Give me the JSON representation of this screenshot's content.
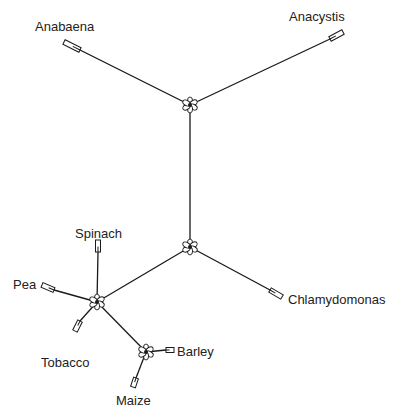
{
  "diagram": {
    "type": "unrooted phylogenetic tree",
    "stroke_color": "#1a1a1a",
    "background": "#ffffff",
    "nodes": [
      {
        "id": "n_top",
        "x": 190,
        "y": 105
      },
      {
        "id": "n_mid",
        "x": 190,
        "y": 247
      },
      {
        "id": "n_plant",
        "x": 97,
        "y": 302
      },
      {
        "id": "n_grass",
        "x": 146,
        "y": 352
      }
    ],
    "leaves": [
      {
        "name": "Anabaena",
        "node": "n_top",
        "tip": [
          64,
          42
        ],
        "box_start": [
          80,
          50
        ],
        "label_pos": [
          35,
          20
        ]
      },
      {
        "name": "Anacystis",
        "node": "n_top",
        "tip": [
          343,
          32
        ],
        "box_start": [
          330,
          39
        ],
        "label_pos": [
          289,
          10
        ]
      },
      {
        "name": "Chlamydomonas",
        "node": "n_mid",
        "tip": [
          282,
          297
        ],
        "box_start": [
          270,
          290
        ],
        "label_pos": [
          288,
          293
        ]
      },
      {
        "name": "Spinach",
        "node": "n_plant",
        "tip": [
          98,
          240
        ],
        "box_start": [
          98,
          252
        ],
        "label_pos": [
          75,
          227
        ]
      },
      {
        "name": "Pea",
        "node": "n_plant",
        "tip": [
          42,
          285
        ],
        "box_start": [
          54,
          290
        ],
        "label_pos": [
          13,
          278
        ]
      },
      {
        "name": "Tobacco",
        "node": "n_plant",
        "tip": [
          75,
          331
        ],
        "box_start": [
          80,
          321
        ],
        "label_pos": [
          41,
          356
        ]
      },
      {
        "name": "Barley",
        "node": "n_grass",
        "tip": [
          174,
          350
        ],
        "box_start": [
          166,
          350
        ],
        "label_pos": [
          177,
          345
        ]
      },
      {
        "name": "Maize",
        "node": "n_grass",
        "tip": [
          133,
          387
        ],
        "box_start": [
          136,
          378
        ],
        "label_pos": [
          116,
          394
        ]
      }
    ],
    "internal_edges": [
      [
        "n_top",
        "n_mid"
      ],
      [
        "n_mid",
        "n_plant"
      ],
      [
        "n_plant",
        "n_grass"
      ]
    ]
  }
}
